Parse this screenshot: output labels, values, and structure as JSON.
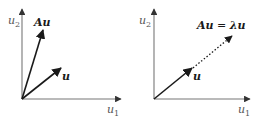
{
  "figure": {
    "panels": [
      {
        "id": "left",
        "axes": {
          "x_label": "u",
          "x_sub": "1",
          "y_label": "u",
          "y_sub": "2"
        },
        "vectors": [
          {
            "name": "Au",
            "label": "Au",
            "style": "solid"
          },
          {
            "name": "u",
            "label": "u",
            "style": "solid"
          }
        ]
      },
      {
        "id": "right",
        "axes": {
          "x_label": "u",
          "x_sub": "1",
          "y_label": "u",
          "y_sub": "2"
        },
        "vectors": [
          {
            "name": "u",
            "label": "u",
            "style": "solid"
          },
          {
            "name": "Au-eigen",
            "label_lhs": "Au",
            "label_eq": " = ",
            "label_rhs": "λu",
            "style": "dotted"
          }
        ]
      }
    ],
    "colors": {
      "axis": "#666666",
      "vector": "#1a1a1a",
      "background": "#ffffff"
    }
  }
}
